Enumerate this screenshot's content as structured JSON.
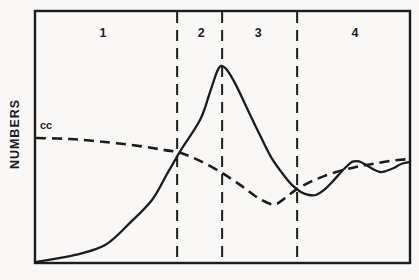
{
  "figure": {
    "background_color": "#f9f8f6",
    "ink_color": "#1c1c1c"
  },
  "chart_data": {
    "type": "line",
    "title": "",
    "xlabel": "",
    "ylabel": "NUMBERS",
    "axes": {
      "x_ticks": [],
      "y_ticks": [],
      "range_frac": [
        0,
        1
      ],
      "grid": false
    },
    "phases": [
      {
        "label": "1",
        "label_x_frac": 0.181
      },
      {
        "label": "2",
        "label_x_frac": 0.443
      },
      {
        "label": "3",
        "label_x_frac": 0.595
      },
      {
        "label": "4",
        "label_x_frac": 0.853
      }
    ],
    "phase_boundaries_x_frac": [
      0.379,
      0.499,
      0.699
    ],
    "annotations": [
      {
        "text": "cc",
        "x_frac": 0.008,
        "y_frac": 0.532
      }
    ],
    "series": [
      {
        "name": "population-numbers",
        "style": "solid",
        "points_frac": [
          [
            0.003,
            0.004
          ],
          [
            0.107,
            0.032
          ],
          [
            0.187,
            0.071
          ],
          [
            0.253,
            0.159
          ],
          [
            0.312,
            0.25
          ],
          [
            0.352,
            0.353
          ],
          [
            0.389,
            0.448
          ],
          [
            0.44,
            0.567
          ],
          [
            0.467,
            0.679
          ],
          [
            0.485,
            0.758
          ],
          [
            0.496,
            0.782
          ],
          [
            0.512,
            0.766
          ],
          [
            0.536,
            0.706
          ],
          [
            0.565,
            0.615
          ],
          [
            0.597,
            0.516
          ],
          [
            0.629,
            0.421
          ],
          [
            0.659,
            0.357
          ],
          [
            0.685,
            0.31
          ],
          [
            0.709,
            0.282
          ],
          [
            0.731,
            0.27
          ],
          [
            0.749,
            0.27
          ],
          [
            0.771,
            0.29
          ],
          [
            0.797,
            0.329
          ],
          [
            0.824,
            0.373
          ],
          [
            0.845,
            0.401
          ],
          [
            0.864,
            0.403
          ],
          [
            0.883,
            0.389
          ],
          [
            0.901,
            0.373
          ],
          [
            0.92,
            0.361
          ],
          [
            0.936,
            0.365
          ],
          [
            0.957,
            0.377
          ],
          [
            0.976,
            0.393
          ],
          [
            1.0,
            0.401
          ]
        ]
      },
      {
        "name": "carrying-capacity",
        "style": "dashed",
        "label": "cc",
        "points_frac": [
          [
            0.003,
            0.496
          ],
          [
            0.093,
            0.492
          ],
          [
            0.187,
            0.48
          ],
          [
            0.28,
            0.464
          ],
          [
            0.347,
            0.448
          ],
          [
            0.389,
            0.437
          ],
          [
            0.44,
            0.405
          ],
          [
            0.499,
            0.357
          ],
          [
            0.547,
            0.31
          ],
          [
            0.587,
            0.266
          ],
          [
            0.621,
            0.238
          ],
          [
            0.643,
            0.234
          ],
          [
            0.667,
            0.258
          ],
          [
            0.699,
            0.294
          ],
          [
            0.733,
            0.321
          ],
          [
            0.771,
            0.345
          ],
          [
            0.813,
            0.365
          ],
          [
            0.856,
            0.381
          ],
          [
            0.899,
            0.393
          ],
          [
            0.947,
            0.405
          ],
          [
            1.0,
            0.413
          ]
        ]
      }
    ]
  }
}
